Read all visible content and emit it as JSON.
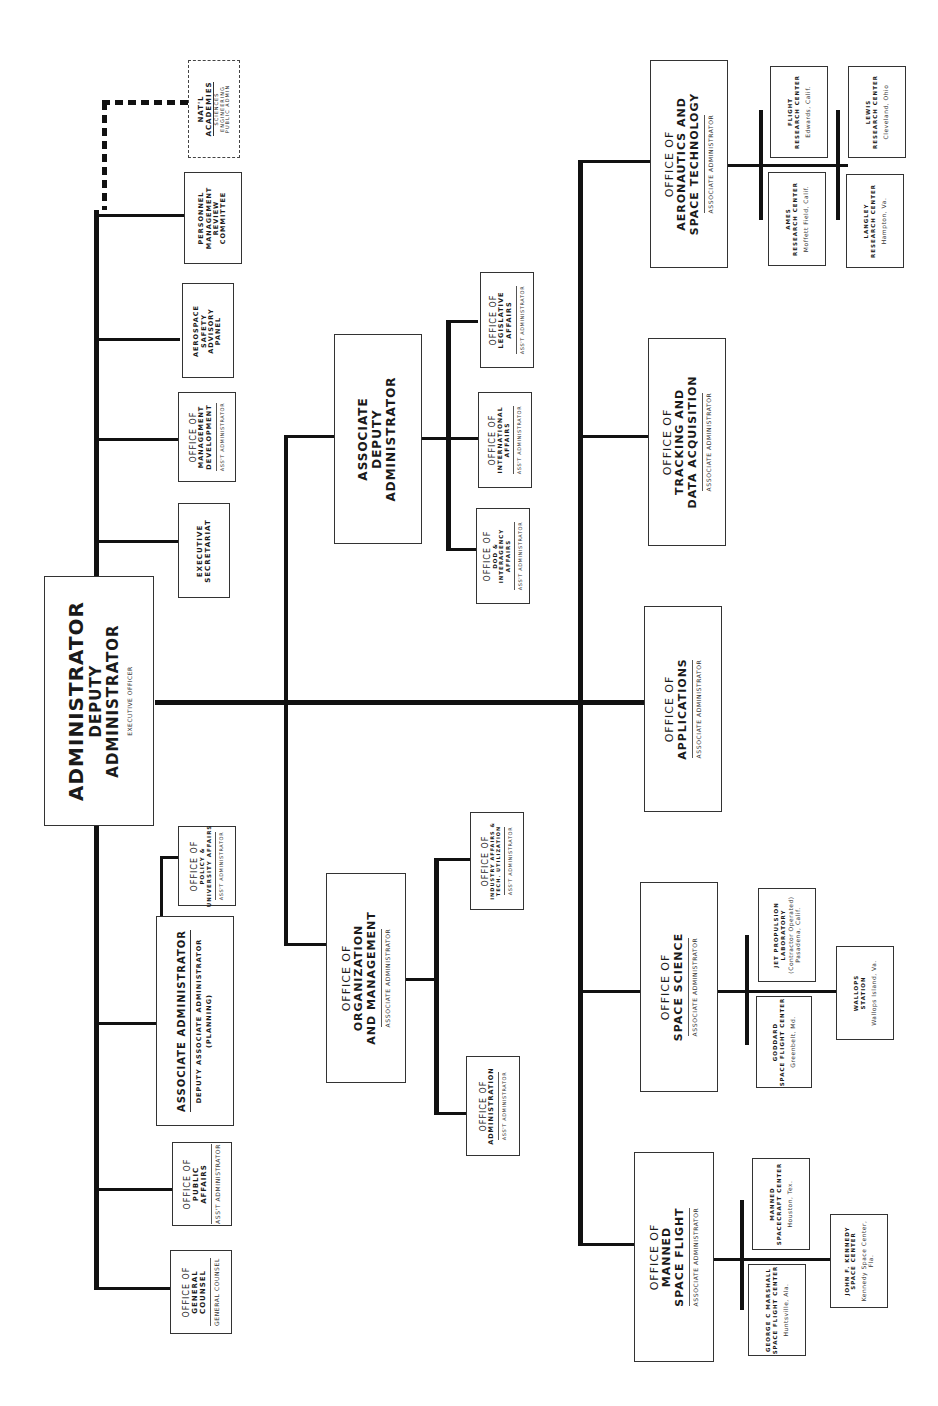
{
  "chart": {
    "orientation": "rotated-90-ccw"
  },
  "nodes": {
    "administrator": {
      "line1": "ADMINISTRATOR",
      "line2": "DEPUTY",
      "line3": "ADMINISTRATOR",
      "sub": "EXECUTIVE OFFICER"
    },
    "general_counsel": {
      "line1": "OFFICE OF",
      "line2": "GENERAL",
      "line3": "COUNSEL",
      "sub": "GENERAL COUNSEL"
    },
    "public_affairs": {
      "line1": "OFFICE OF",
      "line2": "PUBLIC",
      "line3": "AFFAIRS",
      "sub": "ASS'T ADMINISTRATOR"
    },
    "associate_administrator": {
      "line1": "ASSOCIATE ADMINISTRATOR",
      "line2": "DEPUTY ASSOCIATE ADMINISTRATOR",
      "line3": "(PLANNING)"
    },
    "policy_university": {
      "line1": "OFFICE OF",
      "line2": "POLICY &",
      "line3": "UNIVERSITY AFFAIRS",
      "sub": "ASS'T ADMINISTRATOR"
    },
    "executive_secretariat": {
      "line1": "EXECUTIVE",
      "line2": "SECRETARIAT"
    },
    "management_development": {
      "line1": "OFFICE OF",
      "line2": "MANAGEMENT",
      "line3": "DEVELOPMENT",
      "sub": "ASS'T ADMINISTRATOR"
    },
    "aerospace_safety": {
      "line1": "AEROSPACE",
      "line2": "SAFETY",
      "line3": "ADVISORY",
      "line4": "PANEL"
    },
    "personnel_review": {
      "line1": "PERSONNEL",
      "line2": "MANAGEMENT",
      "line3": "REVIEW",
      "line4": "COMMITTEE"
    },
    "natl_academies": {
      "line1": "NAT'L",
      "line2": "ACADEMIES",
      "line3": "SCIENCES",
      "line4": "ENGINEERING",
      "line5": "PUBLIC ADMIN"
    },
    "associate_deputy": {
      "line1": "ASSOCIATE",
      "line2": "DEPUTY",
      "line3": "ADMINISTRATOR"
    },
    "dod_interagency": {
      "line1": "OFFICE OF",
      "line2": "DOD &",
      "line3": "INTERAGENCY",
      "line4": "AFFAIRS",
      "sub": "ASS'T ADMINISTRATOR"
    },
    "international_affairs": {
      "line1": "OFFICE OF",
      "line2": "INTERNATIONAL",
      "line3": "AFFAIRS",
      "sub": "ASS'T ADMINISTRATOR"
    },
    "legislative_affairs": {
      "line1": "OFFICE OF",
      "line2": "LEGISLATIVE",
      "line3": "AFFAIRS",
      "sub": "ASS'T ADMINISTRATOR"
    },
    "organization_management": {
      "line1": "OFFICE OF",
      "line2": "ORGANIZATION",
      "line3": "AND MANAGEMENT",
      "sub": "ASSOCIATE ADMINISTRATOR"
    },
    "administration": {
      "line1": "OFFICE OF",
      "line2": "ADMINISTRATION",
      "sub": "ASS'T ADMINISTRATOR"
    },
    "industry_affairs": {
      "line1": "OFFICE OF",
      "line2": "INDUSTRY AFFAIRS &",
      "line3": "TECH. UTILIZATION",
      "sub": "ASS'T ADMINISTRATOR"
    },
    "manned_space_flight": {
      "line1": "OFFICE OF",
      "line2": "MANNED",
      "line3": "SPACE FLIGHT",
      "sub": "ASSOCIATE ADMINISTRATOR"
    },
    "marshall": {
      "line1": "GEORGE C MARSHALL",
      "line2": "SPACE FLIGHT CENTER",
      "loc": "Huntsville, Ala."
    },
    "manned_spacecraft": {
      "line1": "MANNED",
      "line2": "SPACECRAFT CENTER",
      "loc": "Houston, Tex."
    },
    "kennedy": {
      "line1": "JOHN F. KENNEDY",
      "line2": "SPACE CENTER",
      "loc": "Kennedy Space Center,",
      "loc2": "Fla."
    },
    "space_science": {
      "line1": "OFFICE OF",
      "line2": "SPACE SCIENCE",
      "sub": "ASSOCIATE ADMINISTRATOR"
    },
    "goddard": {
      "line1": "GODDARD",
      "line2": "SPACE FLIGHT CENTER",
      "loc": "Greenbelt, Md."
    },
    "jpl": {
      "line1": "JET PROPULSION",
      "line2": "LABORATORY",
      "loc": "(Contractor Operated)",
      "loc2": "Pasadena, Calif."
    },
    "wallops": {
      "line1": "WALLOPS",
      "line2": "STATION",
      "loc": "Wallops Island, Va."
    },
    "applications": {
      "line1": "OFFICE OF",
      "line2": "APPLICATIONS",
      "sub": "ASSOCIATE ADMINISTRATOR"
    },
    "tracking": {
      "line1": "OFFICE OF",
      "line2": "TRACKING AND",
      "line3": "DATA ACQUISITION",
      "sub": "ASSOCIATE ADMINISTRATOR"
    },
    "aeronautics": {
      "line1": "OFFICE OF",
      "line2": "AERONAUTICS AND",
      "line3": "SPACE TECHNOLOGY",
      "sub": "ASSOCIATE ADMINISTRATOR"
    },
    "ames": {
      "line1": "AMES",
      "line2": "RESEARCH CENTER",
      "loc": "Moffett Field, Calif."
    },
    "flight_research": {
      "line1": "FLIGHT",
      "line2": "RESEARCH CENTER",
      "loc": "Edwards, Calif."
    },
    "langley": {
      "line1": "LANGLEY",
      "line2": "RESEARCH CENTER",
      "loc": "Hampton, Va."
    },
    "lewis": {
      "line1": "LEWIS",
      "line2": "RESEARCH CENTER",
      "loc": "Cleveland, Ohio"
    }
  }
}
